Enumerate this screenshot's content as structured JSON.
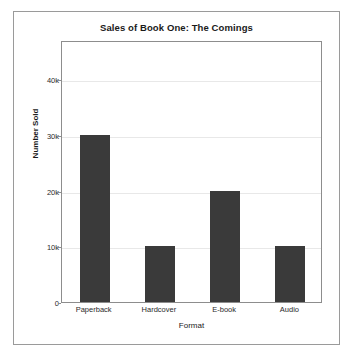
{
  "figure": {
    "background_color": "#ffffff",
    "border_color": "#9a9a9a"
  },
  "chart_data": {
    "type": "bar",
    "title": "Sales of Book One: The Comings",
    "xlabel": "Format",
    "ylabel": "Number Sold",
    "categories": [
      "Paperback",
      "Hardcover",
      "E-book",
      "Audio"
    ],
    "values": [
      30000,
      10000,
      20000,
      10000
    ],
    "value_labels": [
      "30k",
      "10k",
      "20k",
      "10k"
    ],
    "ytick_values": [
      0,
      10000,
      20000,
      30000,
      40000
    ],
    "ytick_labels": [
      "0",
      "10k",
      "20k",
      "30k",
      "40k"
    ],
    "ylim": [
      0,
      47000
    ],
    "grid": true,
    "grid_axis": "y",
    "legend": false,
    "bar_color": "#3a3a3a",
    "grid_color": "#e8e8e8",
    "axis_color": "#8d8d8d"
  }
}
